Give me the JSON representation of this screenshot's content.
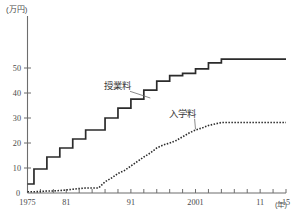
{
  "chart_data": {
    "type": "line",
    "title": "",
    "subtitle": "",
    "xlabel": "年",
    "ylabel": "(万円)",
    "y_unit_label": "(万円)",
    "x_unit_label": "(年)",
    "xlim": [
      1975,
      2015
    ],
    "ylim": [
      0,
      57
    ],
    "yticks": [
      10,
      20,
      30,
      40,
      50
    ],
    "ytick_labels": [
      "10",
      "20",
      "30",
      "40",
      "50"
    ],
    "y_origin_label": "0",
    "xticks": [
      1975,
      1977,
      1979,
      1981,
      1983,
      1985,
      1987,
      1989,
      1991,
      1993,
      1995,
      1997,
      1999,
      2001,
      2003,
      2005,
      2007,
      2009,
      2011,
      2013,
      2015
    ],
    "xtick_labels_shown": [
      {
        "x": 1975,
        "label": "1975"
      },
      {
        "x": 1981,
        "label": "81"
      },
      {
        "x": 1991,
        "label": "91"
      },
      {
        "x": 2001,
        "label": "2001"
      },
      {
        "x": 2011,
        "label": "11"
      },
      {
        "x": 2015,
        "label": "15"
      }
    ],
    "grid": false,
    "legend": "inline-annotations",
    "x": [
      1975,
      1976,
      1977,
      1978,
      1979,
      1980,
      1981,
      1982,
      1983,
      1984,
      1985,
      1986,
      1987,
      1988,
      1989,
      1990,
      1991,
      1992,
      1993,
      1994,
      1995,
      1996,
      1997,
      1998,
      1999,
      2000,
      2001,
      2002,
      2003,
      2004,
      2005,
      2006,
      2007,
      2008,
      2009,
      2010,
      2011,
      2012,
      2013,
      2014,
      2015
    ],
    "series": [
      {
        "name": "授業料",
        "style": "solid",
        "color": "#2b2b2b",
        "values": [
          3.6,
          9.6,
          9.6,
          14.4,
          14.4,
          18.0,
          18.0,
          21.6,
          21.6,
          25.2,
          25.2,
          25.2,
          30.0,
          30.0,
          33.96,
          33.96,
          37.56,
          37.56,
          41.16,
          41.16,
          44.76,
          44.76,
          46.92,
          46.92,
          47.88,
          47.88,
          49.68,
          49.68,
          52.08,
          52.08,
          53.58,
          53.58,
          53.58,
          53.58,
          53.58,
          53.58,
          53.58,
          53.58,
          53.58,
          53.58,
          53.58
        ],
        "final_value": 53.58,
        "plateau_from": 2005
      },
      {
        "name": "入学料",
        "style": "dotted",
        "color": "#2b2b2b",
        "values": [
          0.5,
          0.5,
          0.6,
          0.8,
          0.8,
          1.0,
          1.2,
          1.5,
          1.8,
          2.0,
          2.0,
          2.0,
          4.5,
          6.0,
          7.8,
          9.0,
          10.8,
          12.6,
          14.4,
          16.0,
          18.0,
          19.2,
          20.0,
          21.0,
          22.5,
          24.0,
          25.2,
          26.0,
          27.0,
          27.6,
          28.2,
          28.2,
          28.2,
          28.2,
          28.2,
          28.2,
          28.2,
          28.2,
          28.2,
          28.2,
          28.2
        ],
        "final_value": 28.2,
        "plateau_from": 2005
      }
    ],
    "annotations": [
      {
        "label": "授業料",
        "x_text": 1989,
        "y_text": 41.5,
        "points_to_x": 1994,
        "points_to_y": 38.0
      },
      {
        "label": "入学料",
        "x_text": 1999,
        "y_text": 30.5,
        "points_to_x": 2001,
        "points_to_y": 25.5
      }
    ]
  }
}
